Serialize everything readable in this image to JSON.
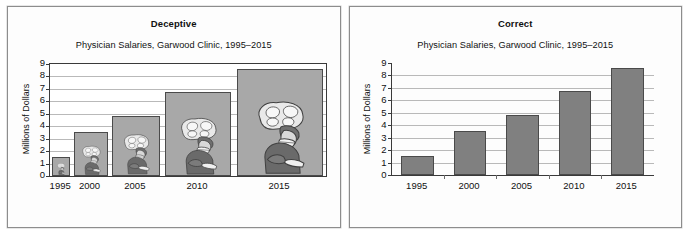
{
  "figure": {
    "background": "#ffffff",
    "panel_border": "#8d8d8d"
  },
  "panels": [
    {
      "key": "deceptive",
      "heading": "Deceptive",
      "subtitle": "Physician Salaries, Garwood Clinic, 1995–2015",
      "ylabel": "Millions of Dollars",
      "style": "pictogram",
      "note_icon": "physician-pictogram"
    },
    {
      "key": "correct",
      "heading": "Correct",
      "subtitle": "Physician Salaries, Garwood Clinic, 1995–2015",
      "ylabel": "Millions of Dollars",
      "style": "plain-bars"
    }
  ],
  "colors": {
    "bar_fill": "#808080",
    "bar_stroke": "#4a4a4a",
    "pictogram_fill": "#a8a8a8",
    "gridline": "#b9b9b9",
    "axis": "#3a3a3a",
    "text": "#111111"
  },
  "chart_data": [
    {
      "type": "bar",
      "id": "deceptive",
      "title": "Deceptive",
      "subtitle": "Physician Salaries, Garwood Clinic, 1995–2015",
      "xlabel": "",
      "ylabel": "Millions of Dollars",
      "categories": [
        "1995",
        "2000",
        "2005",
        "2010",
        "2015"
      ],
      "values": [
        1.5,
        3.5,
        4.8,
        6.75,
        8.6
      ],
      "bar_widths_px": [
        18,
        34,
        48,
        66,
        86
      ],
      "ylim": [
        0,
        9
      ],
      "yticks": [
        0,
        1,
        2,
        3,
        4,
        5,
        6,
        7,
        8,
        9
      ],
      "grid": true,
      "legend": "none",
      "distortion": "bar width scales with height, exaggerating growth by area"
    },
    {
      "type": "bar",
      "id": "correct",
      "title": "Correct",
      "subtitle": "Physician Salaries, Garwood Clinic, 1995–2015",
      "xlabel": "",
      "ylabel": "Millions of Dollars",
      "categories": [
        "1995",
        "2000",
        "2005",
        "2010",
        "2015"
      ],
      "values": [
        1.5,
        3.5,
        4.8,
        6.75,
        8.6
      ],
      "ylim": [
        0,
        9
      ],
      "yticks": [
        0,
        1,
        2,
        3,
        4,
        5,
        6,
        7,
        8,
        9
      ],
      "grid": true,
      "legend": "none"
    }
  ]
}
